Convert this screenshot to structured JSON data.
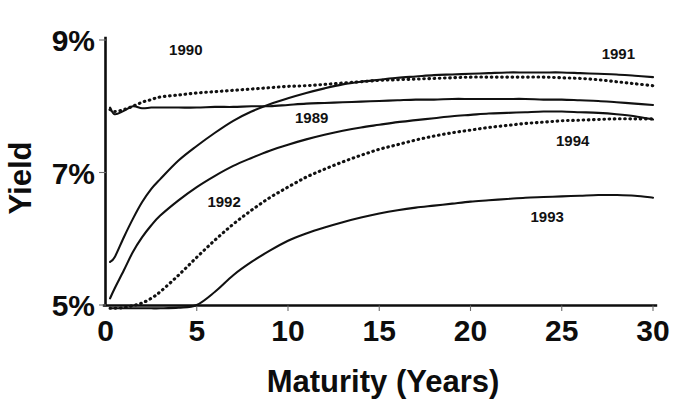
{
  "chart_data": {
    "type": "line",
    "title": "",
    "xlabel": "Maturity  (Years)",
    "ylabel": "Yield",
    "xlim": [
      0,
      30
    ],
    "ylim": [
      5,
      9
    ],
    "grid": false,
    "legend_position": "inline-annotations",
    "xticks": [
      "0",
      "5",
      "10",
      "15",
      "20",
      "25",
      "30"
    ],
    "xtick_values": [
      0,
      5,
      10,
      15,
      20,
      25,
      30
    ],
    "yticks": [
      "5%",
      "7%",
      "9%"
    ],
    "ytick_values": [
      5,
      7,
      9
    ],
    "x": [
      0.25,
      0.5,
      1,
      1.5,
      2,
      2.5,
      3,
      4,
      5,
      6,
      7,
      8,
      9,
      10,
      11,
      12,
      13,
      14,
      15,
      16,
      17,
      18,
      19,
      20,
      21,
      22,
      23,
      24,
      25,
      26,
      27,
      28,
      29,
      30
    ],
    "series": [
      {
        "name": "1989",
        "style": "solid",
        "label": "1989",
        "label_x": 11.3,
        "label_y": 7.75,
        "values": [
          7.98,
          7.88,
          7.93,
          8.0,
          7.97,
          7.98,
          7.98,
          7.98,
          7.98,
          7.99,
          7.99,
          8.0,
          8.0,
          8.02,
          8.04,
          8.05,
          8.06,
          8.07,
          8.08,
          8.09,
          8.1,
          8.1,
          8.11,
          8.11,
          8.11,
          8.11,
          8.11,
          8.1,
          8.1,
          8.09,
          8.08,
          8.06,
          8.04,
          8.02
        ]
      },
      {
        "name": "1990",
        "style": "dotted",
        "label": "1990",
        "label_x": 4.4,
        "label_y": 8.78,
        "values": [
          7.95,
          7.92,
          7.95,
          8.0,
          8.06,
          8.1,
          8.14,
          8.17,
          8.2,
          8.22,
          8.24,
          8.26,
          8.28,
          8.3,
          8.31,
          8.33,
          8.35,
          8.37,
          8.39,
          8.4,
          8.41,
          8.42,
          8.43,
          8.44,
          8.44,
          8.44,
          8.44,
          8.44,
          8.43,
          8.42,
          8.4,
          8.37,
          8.34,
          8.31
        ]
      },
      {
        "name": "1991",
        "style": "solid",
        "label": "1991",
        "label_x": 28.1,
        "label_y": 8.72,
        "values": [
          5.65,
          5.72,
          6.02,
          6.3,
          6.55,
          6.75,
          6.9,
          7.18,
          7.4,
          7.6,
          7.78,
          7.92,
          8.03,
          8.12,
          8.2,
          8.27,
          8.33,
          8.37,
          8.4,
          8.43,
          8.45,
          8.47,
          8.48,
          8.49,
          8.5,
          8.51,
          8.51,
          8.51,
          8.51,
          8.5,
          8.49,
          8.48,
          8.46,
          8.44
        ]
      },
      {
        "name": "1992",
        "style": "dotted",
        "label": "1992",
        "label_x": 6.5,
        "label_y": 6.48,
        "values": [
          4.95,
          4.95,
          4.96,
          4.99,
          5.03,
          5.1,
          5.2,
          5.45,
          5.72,
          5.98,
          6.22,
          6.43,
          6.62,
          6.78,
          6.93,
          7.05,
          7.16,
          7.26,
          7.35,
          7.42,
          7.49,
          7.55,
          7.6,
          7.64,
          7.68,
          7.71,
          7.74,
          7.76,
          7.78,
          7.79,
          7.8,
          7.81,
          7.81,
          7.81
        ]
      },
      {
        "name": "1993",
        "style": "solid",
        "label": "1993",
        "label_x": 24.2,
        "label_y": 6.26,
        "values": [
          4.95,
          4.95,
          4.95,
          4.95,
          4.95,
          4.95,
          4.95,
          4.96,
          5.0,
          5.2,
          5.45,
          5.65,
          5.82,
          5.97,
          6.08,
          6.17,
          6.25,
          6.32,
          6.38,
          6.43,
          6.47,
          6.5,
          6.53,
          6.56,
          6.58,
          6.6,
          6.62,
          6.63,
          6.64,
          6.65,
          6.66,
          6.66,
          6.65,
          6.62
        ]
      },
      {
        "name": "1994",
        "style": "solid",
        "label": "1994",
        "label_x": 25.6,
        "label_y": 7.4,
        "values": [
          5.1,
          5.25,
          5.52,
          5.8,
          6.02,
          6.2,
          6.35,
          6.58,
          6.78,
          6.95,
          7.1,
          7.22,
          7.33,
          7.42,
          7.5,
          7.57,
          7.63,
          7.68,
          7.72,
          7.76,
          7.79,
          7.82,
          7.85,
          7.87,
          7.89,
          7.9,
          7.91,
          7.92,
          7.92,
          7.91,
          7.9,
          7.88,
          7.85,
          7.8
        ]
      }
    ]
  },
  "axes": {
    "y_title": "Yield",
    "x_title": "Maturity  (Years)"
  }
}
